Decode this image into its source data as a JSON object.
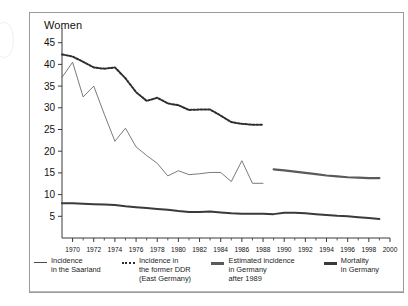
{
  "figure": {
    "plot_title": "Women"
  },
  "legend": {
    "items": [
      {
        "marker": "thin-solid-line-icon",
        "label": "Incidence\nin the Saarland"
      },
      {
        "marker": "dotted-line-icon",
        "label": "Incidence in\nthe former DDR\n(East Germany)"
      },
      {
        "marker": "thick-gray-line-icon",
        "label": "Estimated incidence\nin Germany\nafter 1989"
      },
      {
        "marker": "thick-dark-line-icon",
        "label": "Mortality\nin Germany"
      }
    ]
  },
  "chart_data": {
    "type": "line",
    "title": "Women",
    "xlabel": "",
    "ylabel": "",
    "xlim": [
      1969,
      2000
    ],
    "ylim": [
      0,
      47
    ],
    "yticks": [
      5,
      10,
      15,
      20,
      25,
      30,
      35,
      40,
      45
    ],
    "xticks": [
      1970,
      1972,
      1974,
      1976,
      1978,
      1980,
      1982,
      1984,
      1986,
      1988,
      1990,
      1992,
      1994,
      1996,
      1998,
      2000
    ],
    "xtick_labels": [
      "1970",
      "1972",
      "1974",
      "1976",
      "1978",
      "1980",
      "1982",
      "1984",
      "1986",
      "1988",
      "1990",
      "1992",
      "1994",
      "1996",
      "1998",
      "2000"
    ],
    "minor_xticks_every": 1,
    "grid": false,
    "legend_position": "below",
    "series": [
      {
        "name": "Incidence in the Saarland",
        "style": "thin-solid",
        "color": "#6b6b6b",
        "x": [
          1969,
          1970,
          1971,
          1972,
          1973,
          1974,
          1975,
          1976,
          1977,
          1978,
          1979,
          1980,
          1981,
          1982,
          1983,
          1984,
          1985,
          1986,
          1987,
          1988
        ],
        "values": [
          37.0,
          40.5,
          32.5,
          35.0,
          28.5,
          22.3,
          25.3,
          21.0,
          19.0,
          17.2,
          14.3,
          15.5,
          14.6,
          14.8,
          15.1,
          15.1,
          13.0,
          17.8,
          12.6,
          12.6
        ]
      },
      {
        "name": "Incidence in the former DDR (East Germany)",
        "style": "dotted",
        "color": "#2d2d2d",
        "x": [
          1969,
          1970,
          1971,
          1972,
          1973,
          1974,
          1975,
          1976,
          1977,
          1978,
          1979,
          1980,
          1981,
          1982,
          1983,
          1984,
          1985,
          1986,
          1987,
          1988
        ],
        "values": [
          42.3,
          41.8,
          40.6,
          39.3,
          39.0,
          39.3,
          36.8,
          33.6,
          31.6,
          32.3,
          31.0,
          30.6,
          29.5,
          29.6,
          29.6,
          28.2,
          26.7,
          26.3,
          26.1,
          26.1
        ]
      },
      {
        "name": "Estimated incidence in Germany after 1989",
        "style": "thick-gray",
        "color": "#5a5a5a",
        "x": [
          1989,
          1990,
          1991,
          1992,
          1993,
          1994,
          1995,
          1996,
          1997,
          1998,
          1999
        ],
        "values": [
          15.8,
          15.6,
          15.3,
          15.0,
          14.7,
          14.4,
          14.2,
          14.0,
          13.9,
          13.8,
          13.8
        ]
      },
      {
        "name": "Mortality in Germany",
        "style": "thick-dark",
        "color": "#3a3a3a",
        "x": [
          1969,
          1970,
          1971,
          1972,
          1973,
          1974,
          1975,
          1976,
          1977,
          1978,
          1979,
          1980,
          1981,
          1982,
          1983,
          1984,
          1985,
          1986,
          1987,
          1988,
          1989,
          1990,
          1991,
          1992,
          1993,
          1994,
          1995,
          1996,
          1997,
          1998,
          1999
        ],
        "values": [
          8.0,
          8.0,
          7.9,
          7.8,
          7.7,
          7.6,
          7.3,
          7.1,
          6.9,
          6.7,
          6.5,
          6.2,
          6.0,
          6.0,
          6.1,
          5.9,
          5.7,
          5.6,
          5.6,
          5.6,
          5.5,
          5.8,
          5.8,
          5.7,
          5.5,
          5.3,
          5.1,
          5.0,
          4.8,
          4.6,
          4.4
        ]
      }
    ]
  }
}
